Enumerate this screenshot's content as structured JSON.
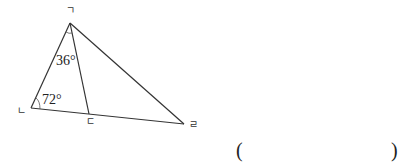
{
  "diagram": {
    "type": "triangle-geometry",
    "vertices": {
      "top": "ㄱ",
      "left": "ㄴ",
      "middle": "ㄷ",
      "right": "ㄹ"
    },
    "angles": {
      "angle_at_top_inner": "36°",
      "angle_at_left": "72°"
    },
    "segments": [
      "ㄱㄴ",
      "ㄱㄷ",
      "ㄱㄹ",
      "ㄴㄷ",
      "ㄷㄹ"
    ],
    "colors": {
      "line": "#333333",
      "text": "#222222",
      "background": "#ffffff"
    }
  },
  "answer": {
    "open": "(",
    "close": ")",
    "value": ""
  }
}
